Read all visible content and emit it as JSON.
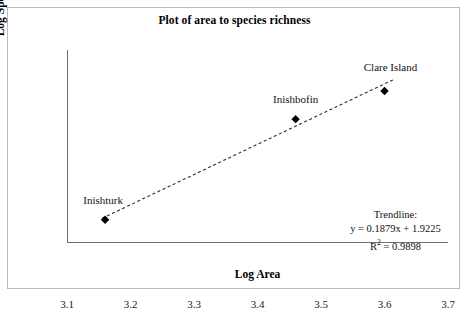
{
  "chart_data": {
    "type": "scatter",
    "title": "Plot of area to species richness",
    "xlabel": "Log Area",
    "ylabel": "Log Species Number",
    "xlim": [
      3.1,
      3.7
    ],
    "ylim": [
      2.5,
      2.62
    ],
    "xticks": [
      "3.1",
      "3.2",
      "3.3",
      "3.4",
      "3.5",
      "3.6",
      "3.7"
    ],
    "yticks": [
      "2.50",
      "2.52",
      "2.54",
      "2.56",
      "2.58",
      "2.60",
      "2.62"
    ],
    "xtick_values": [
      3.1,
      3.2,
      3.3,
      3.4,
      3.5,
      3.6,
      3.7
    ],
    "ytick_values": [
      2.5,
      2.52,
      2.54,
      2.56,
      2.58,
      2.6,
      2.62
    ],
    "grid": false,
    "legend": "none",
    "points": [
      {
        "label": "Inishturk",
        "x": 3.16,
        "y": 2.5145
      },
      {
        "label": "Inishbofin",
        "x": 3.46,
        "y": 2.577
      },
      {
        "label": "Clare Island",
        "x": 3.6,
        "y": 2.5945
      }
    ],
    "trendline": {
      "heading": "Trendline:",
      "equation": "y = 0.1879x + 1.9225",
      "r2_prefix": "R",
      "r2_exponent": "2",
      "r2_value": " = 0.9898",
      "slope": 0.1879,
      "intercept": 1.9225,
      "r_squared": 0.9898,
      "style": "dashed",
      "x_start": 3.155,
      "x_end": 3.615
    },
    "colors": {
      "marker": "#000000",
      "trendline": "#2a2a2a",
      "axis": "#6f6f6f",
      "text": "#111111",
      "frame": "#b9b9b9",
      "background": "#ffffff"
    }
  }
}
